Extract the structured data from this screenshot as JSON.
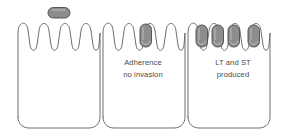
{
  "diagram": {
    "background_color": "#ffffff",
    "outline_color": "#6e6e6e",
    "bacterium_fill": "#8d8d8d",
    "bacterium_stroke": "#4a4a4a",
    "text_color": "#4a4a4a"
  },
  "cells": [
    {
      "id": "cell-left",
      "label": "epithelial-cell-normal-microvilli",
      "microvilli_count": 5,
      "attached_bacteria": 0,
      "caption": null
    },
    {
      "id": "cell-middle",
      "label": "epithelial-cell-adherence",
      "microvilli_count": 5,
      "attached_bacteria": 1,
      "caption": {
        "lines": [
          "Adherence",
          "no invasion"
        ]
      }
    },
    {
      "id": "cell-right",
      "label": "epithelial-cell-toxin-production",
      "microvilli_count": 5,
      "attached_bacteria": 4,
      "caption": {
        "lines": [
          "LT and ST",
          "produced"
        ]
      }
    }
  ],
  "free_bacterium": {
    "label": "free-floating-bacterium",
    "orientation": "horizontal",
    "count": 1
  }
}
